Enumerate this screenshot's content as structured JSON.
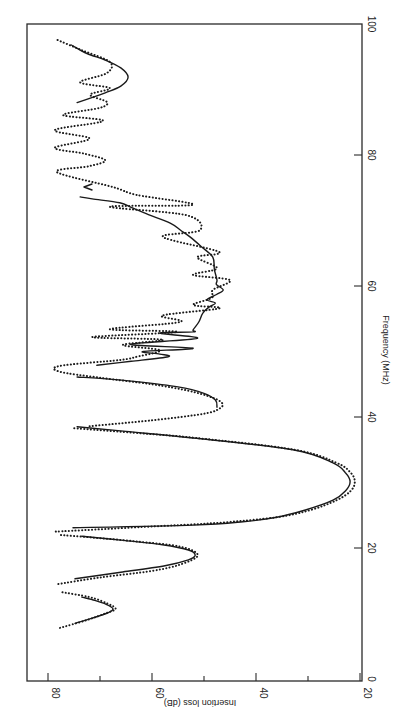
{
  "chart_data": {
    "type": "line",
    "orientation": "rotated 90° (frequency on vertical right axis, insertion loss on bottom horizontal axis, reversed)",
    "title": "",
    "xlabel": "Frequency (MHz)",
    "ylabel": "Insertion loss (dB)",
    "xlim": [
      0,
      100
    ],
    "ylim": [
      20,
      85
    ],
    "x_ticks": [
      0,
      20,
      40,
      60,
      80,
      100
    ],
    "y_ticks": [
      20,
      40,
      60,
      80
    ],
    "y_minor_ticks": [
      30,
      50,
      70
    ],
    "grid": false,
    "legend": null,
    "series": [
      {
        "name": "Theoretical (solid)",
        "style": "solid",
        "segments": [
          [
            [
              8.5,
              74.8
            ],
            [
              9.3,
              71.5
            ],
            [
              10.0,
              68.8
            ],
            [
              10.7,
              67.5
            ],
            [
              11.4,
              68.8
            ],
            [
              12.0,
              71.0
            ],
            [
              12.5,
              73.5
            ]
          ],
          [
            [
              15.3,
              74.8
            ],
            [
              16.3,
              66.0
            ],
            [
              17.3,
              57.5
            ],
            [
              18.2,
              53.0
            ],
            [
              18.9,
              51.7
            ],
            [
              19.7,
              53.0
            ],
            [
              20.5,
              58.0
            ],
            [
              21.2,
              66.0
            ],
            [
              21.8,
              73.5
            ]
          ],
          [
            [
              23.1,
              75.2
            ],
            [
              23.5,
              52.1
            ],
            [
              24.0,
              42.5
            ],
            [
              24.7,
              36.0
            ],
            [
              25.8,
              30.5
            ],
            [
              27.3,
              25.2
            ],
            [
              28.7,
              22.8
            ],
            [
              30.1,
              21.9
            ],
            [
              31.5,
              22.8
            ],
            [
              33.0,
              25.2
            ],
            [
              35.0,
              32.9
            ],
            [
              36.8,
              52.1
            ],
            [
              37.8,
              65.0
            ],
            [
              38.5,
              74.4
            ]
          ],
          [
            [
              41.5,
              47.5
            ],
            [
              42.6,
              47.8
            ],
            [
              43.6,
              50.0
            ],
            [
              44.6,
              55.0
            ],
            [
              45.4,
              63.0
            ],
            [
              45.9,
              70.0
            ],
            [
              46.1,
              74.4
            ]
          ],
          [
            [
              47.9,
              70.6
            ],
            [
              48.5,
              64.0
            ],
            [
              49.2,
              56.9
            ],
            [
              49.6,
              58.5
            ],
            [
              50.0,
              61.7
            ],
            [
              50.5,
              52.1
            ],
            [
              51.1,
              64.2
            ],
            [
              52.0,
              51.3
            ],
            [
              52.8,
              58.5
            ],
            [
              53.0,
              52.1
            ],
            [
              53.3,
              52.1
            ],
            [
              54.5,
              51.0
            ],
            [
              55.9,
              50.2
            ],
            [
              56.8,
              49.0
            ],
            [
              57.4,
              47.8
            ],
            [
              57.9,
              49.4
            ],
            [
              58.7,
              47.6
            ],
            [
              59.4,
              46.3
            ],
            [
              60.2,
              47.6
            ],
            [
              60.9,
              47.5
            ],
            [
              62.5,
              48.0
            ],
            [
              64.4,
              48.3
            ],
            [
              66.0,
              50.5
            ],
            [
              67.5,
              52.7
            ],
            [
              68.5,
              54.5
            ],
            [
              69.6,
              56.5
            ],
            [
              71.0,
              61.0
            ],
            [
              72.0,
              64.0
            ],
            [
              72.7,
              66.2
            ],
            [
              73.3,
              71.5
            ],
            [
              73.6,
              73.8
            ]
          ]
        ]
      },
      {
        "name": "Measured (dotted)",
        "style": "dotted",
        "segments": [
          [
            [
              7.8,
              77.7
            ],
            [
              9.0,
              72.5
            ],
            [
              10.0,
              69.0
            ],
            [
              10.7,
              67.0
            ],
            [
              11.5,
              68.5
            ],
            [
              12.5,
              72.0
            ],
            [
              13.3,
              77.7
            ]
          ],
          [
            [
              14.5,
              78.0
            ],
            [
              15.5,
              70.0
            ],
            [
              16.5,
              60.0
            ],
            [
              17.5,
              54.5
            ],
            [
              18.9,
              51.2
            ],
            [
              20.2,
              54.5
            ],
            [
              21.0,
              63.0
            ],
            [
              21.6,
              71.5
            ],
            [
              22.0,
              78.0
            ]
          ],
          [
            [
              22.5,
              78.5
            ],
            [
              23.2,
              62.0
            ],
            [
              23.8,
              48.0
            ],
            [
              24.7,
              36.0
            ],
            [
              25.8,
              29.5
            ],
            [
              27.3,
              24.5
            ],
            [
              28.7,
              21.8
            ],
            [
              30.1,
              21.0
            ],
            [
              31.5,
              21.8
            ],
            [
              33.0,
              24.5
            ],
            [
              35.0,
              32.5
            ],
            [
              36.8,
              51.5
            ],
            [
              37.5,
              62.0
            ],
            [
              38.3,
              75.2
            ]
          ],
          [
            [
              38.6,
              72.0
            ],
            [
              39.5,
              60.0
            ],
            [
              40.5,
              50.0
            ],
            [
              41.3,
              47.0
            ],
            [
              42.1,
              46.5
            ],
            [
              43.0,
              48.5
            ],
            [
              44.0,
              53.0
            ],
            [
              45.0,
              60.0
            ],
            [
              46.0,
              70.0
            ],
            [
              46.9,
              77.7
            ],
            [
              47.8,
              77.7
            ],
            [
              48.7,
              66.2
            ],
            [
              49.2,
              62.9
            ],
            [
              50.2,
              58.5
            ],
            [
              51.0,
              65.6
            ],
            [
              51.8,
              57.9
            ],
            [
              52.2,
              71.5
            ],
            [
              53.0,
              55.2
            ],
            [
              53.4,
              68.1
            ],
            [
              54.5,
              54.6
            ],
            [
              55.5,
              58.0
            ],
            [
              56.6,
              47.0
            ],
            [
              57.1,
              52.1
            ],
            [
              58.2,
              48.5
            ],
            [
              59.4,
              48.3
            ],
            [
              60.9,
              45.0
            ],
            [
              61.7,
              52.1
            ],
            [
              62.7,
              47.5
            ],
            [
              64.4,
              51.3
            ],
            [
              65.2,
              47.1
            ],
            [
              67.5,
              57.9
            ],
            [
              68.5,
              50.8
            ],
            [
              70.8,
              53.3
            ],
            [
              72.1,
              68.1
            ],
            [
              72.4,
              52.1
            ],
            [
              73.9,
              62.9
            ],
            [
              75.1,
              67.5
            ],
            [
              77.4,
              78.3
            ],
            [
              78.3,
              72.0
            ],
            [
              79.2,
              69.0
            ],
            [
              80.2,
              73.0
            ],
            [
              81.1,
              78.7
            ],
            [
              82.5,
              72.0
            ],
            [
              83.8,
              78.7
            ],
            [
              85.2,
              69.4
            ],
            [
              86.1,
              77.1
            ],
            [
              87.2,
              70.0
            ],
            [
              88.1,
              68.7
            ],
            [
              89.2,
              71.9
            ],
            [
              90.2,
              68.1
            ],
            [
              91.1,
              73.8
            ],
            [
              92.5,
              68.7
            ],
            [
              94.2,
              68.1
            ],
            [
              96.0,
              73.5
            ],
            [
              97.6,
              78.3
            ]
          ]
        ]
      },
      {
        "name": "Theoretical (solid) upper",
        "style": "solid",
        "segments": [
          [
            [
              88.0,
              74.4
            ],
            [
              89.5,
              69.0
            ],
            [
              90.5,
              66.0
            ],
            [
              91.9,
              64.6
            ],
            [
              93.3,
              66.0
            ],
            [
              94.5,
              69.0
            ],
            [
              95.5,
              72.5
            ],
            [
              96.8,
              75.5
            ]
          ]
        ]
      }
    ],
    "annotations": [
      {
        "text": "small 'V' mark",
        "freq": 75.0,
        "dB": 73.3
      }
    ]
  },
  "axes": {
    "freq_label": "Frequency (MHz)",
    "loss_label": "Insertion loss (dB)",
    "freq_tick_labels": [
      "0",
      "20",
      "40",
      "60",
      "80",
      "100"
    ],
    "loss_tick_labels": [
      "80",
      "60",
      "40",
      "20"
    ]
  }
}
